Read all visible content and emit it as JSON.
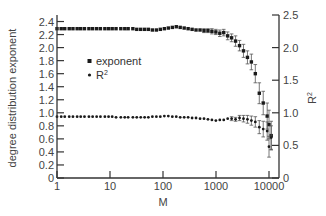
{
  "chart_data": {
    "type": "scatter",
    "title": "",
    "xlabel": "M",
    "ylabel": "degree distribution exponent",
    "ylabel_right": "R²",
    "xscale": "log",
    "xlim": [
      1,
      15000
    ],
    "ylim": [
      0,
      2.5
    ],
    "ylim_right": [
      0,
      2.5
    ],
    "x_ticks": [
      1,
      10,
      100,
      1000,
      10000
    ],
    "x_tick_labels": [
      "1",
      "10",
      "100",
      "1000",
      "10000"
    ],
    "y_ticks": [
      0,
      0.2,
      0.4,
      0.6,
      0.8,
      1.0,
      1.2,
      1.4,
      1.6,
      1.8,
      2.0,
      2.2,
      2.4
    ],
    "y_tick_labels": [
      "0",
      "0.2",
      "0.4",
      "0.6",
      "0.8",
      "1.0",
      "1.2",
      "1.4",
      "1.6",
      "1.8",
      "2.0",
      "2.2",
      "2.4"
    ],
    "y_right_ticks": [
      0,
      0.5,
      1.0,
      1.5,
      2.0,
      2.5
    ],
    "y_right_tick_labels": [
      "0",
      "0.5",
      "1.0",
      "1.5",
      "2.0",
      "2.5"
    ],
    "grid": false,
    "legend_position": "upper-left-inside",
    "series": [
      {
        "name": "exponent",
        "marker": "square",
        "axis": "left",
        "x": [
          1,
          1.2,
          1.4,
          1.7,
          2,
          2.4,
          2.8,
          3.3,
          4,
          4.7,
          5.6,
          6.6,
          8,
          9.4,
          11,
          13,
          16,
          19,
          22,
          27,
          32,
          38,
          45,
          53,
          63,
          75,
          89,
          106,
          126,
          150,
          178,
          211,
          251,
          298,
          354,
          420,
          500,
          594,
          705,
          837,
          994,
          1180,
          1400,
          1660,
          1970,
          2340,
          2780,
          3300,
          3920,
          4650,
          5520,
          6560,
          7780,
          9240,
          10000,
          11000
        ],
        "y": [
          2.29,
          2.29,
          2.29,
          2.29,
          2.29,
          2.29,
          2.29,
          2.29,
          2.29,
          2.29,
          2.29,
          2.29,
          2.29,
          2.29,
          2.29,
          2.29,
          2.29,
          2.29,
          2.29,
          2.29,
          2.28,
          2.28,
          2.28,
          2.28,
          2.27,
          2.27,
          2.28,
          2.29,
          2.3,
          2.31,
          2.32,
          2.31,
          2.3,
          2.29,
          2.28,
          2.27,
          2.27,
          2.26,
          2.26,
          2.25,
          2.24,
          2.22,
          2.23,
          2.18,
          2.15,
          2.1,
          2.03,
          1.95,
          1.85,
          1.78,
          1.6,
          1.3,
          1.15,
          0.95,
          0.82,
          0.65
        ],
        "err": [
          0.01,
          0.01,
          0.01,
          0.01,
          0.01,
          0.01,
          0.01,
          0.01,
          0.01,
          0.01,
          0.01,
          0.01,
          0.01,
          0.01,
          0.01,
          0.01,
          0.01,
          0.01,
          0.01,
          0.01,
          0.01,
          0.01,
          0.01,
          0.01,
          0.01,
          0.01,
          0.01,
          0.02,
          0.02,
          0.02,
          0.02,
          0.02,
          0.02,
          0.02,
          0.02,
          0.02,
          0.02,
          0.03,
          0.03,
          0.04,
          0.04,
          0.05,
          0.05,
          0.06,
          0.06,
          0.08,
          0.08,
          0.1,
          0.1,
          0.12,
          0.14,
          0.16,
          0.18,
          0.2,
          0.22,
          0.22
        ]
      },
      {
        "name": "R²",
        "marker": "circle",
        "axis": "right",
        "x": [
          1,
          1.2,
          1.4,
          1.7,
          2,
          2.4,
          2.8,
          3.3,
          4,
          4.7,
          5.6,
          6.6,
          8,
          9.4,
          11,
          13,
          16,
          19,
          22,
          27,
          32,
          38,
          45,
          53,
          63,
          75,
          89,
          106,
          126,
          150,
          178,
          211,
          251,
          298,
          354,
          420,
          500,
          594,
          705,
          837,
          994,
          1180,
          1400,
          1660,
          1970,
          2340,
          2780,
          3300,
          3920,
          4650,
          5520,
          6560,
          7780,
          9240,
          10000,
          11000
        ],
        "y": [
          0.94,
          0.94,
          0.94,
          0.94,
          0.94,
          0.94,
          0.94,
          0.94,
          0.94,
          0.94,
          0.94,
          0.94,
          0.94,
          0.94,
          0.94,
          0.93,
          0.93,
          0.93,
          0.93,
          0.93,
          0.93,
          0.93,
          0.93,
          0.93,
          0.94,
          0.94,
          0.94,
          0.95,
          0.95,
          0.94,
          0.94,
          0.93,
          0.93,
          0.93,
          0.92,
          0.92,
          0.91,
          0.91,
          0.9,
          0.89,
          0.88,
          0.89,
          0.89,
          0.91,
          0.91,
          0.9,
          0.92,
          0.91,
          0.9,
          0.88,
          0.86,
          0.78,
          0.75,
          0.72,
          0.48,
          0.62
        ],
        "err": [
          0.01,
          0.01,
          0.01,
          0.01,
          0.01,
          0.01,
          0.01,
          0.01,
          0.01,
          0.01,
          0.01,
          0.01,
          0.01,
          0.01,
          0.01,
          0.01,
          0.01,
          0.01,
          0.01,
          0.01,
          0.01,
          0.01,
          0.01,
          0.01,
          0.01,
          0.01,
          0.01,
          0.01,
          0.01,
          0.01,
          0.01,
          0.01,
          0.01,
          0.01,
          0.01,
          0.01,
          0.01,
          0.01,
          0.02,
          0.02,
          0.02,
          0.02,
          0.02,
          0.02,
          0.03,
          0.03,
          0.04,
          0.05,
          0.06,
          0.07,
          0.08,
          0.1,
          0.12,
          0.14,
          0.16,
          0.18
        ]
      }
    ]
  },
  "legend": {
    "items": [
      {
        "label": "exponent",
        "marker": "square"
      },
      {
        "label": "R",
        "sup": "2",
        "marker": "circle"
      }
    ]
  },
  "axes": {
    "xlabel": "M",
    "ylabel_left": "degree distribution exponent",
    "ylabel_right": "R",
    "ylabel_right_sup": "2"
  },
  "colors": {
    "axis": "#333333",
    "marker": "#1a1a1a",
    "errorbar": "#555555",
    "text": "#444444"
  }
}
